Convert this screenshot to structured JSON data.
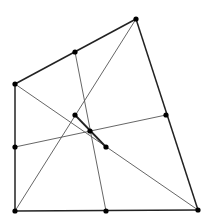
{
  "diagram": {
    "kind": "quadrilateral-varignon-newton",
    "colors": {
      "background": "#ffffff",
      "edge": "#222222",
      "thin_line": "#555555",
      "point": "#000000"
    },
    "vertices": [
      {
        "id": "A",
        "x": 15,
        "y": 84
      },
      {
        "id": "B",
        "x": 136,
        "y": 19
      },
      {
        "id": "C",
        "x": 198,
        "y": 210
      },
      {
        "id": "D",
        "x": 15,
        "y": 211
      }
    ],
    "side_midpoints": [
      {
        "id": "M_AB",
        "x": 75,
        "y": 52
      },
      {
        "id": "M_BC",
        "x": 166,
        "y": 115
      },
      {
        "id": "M_CD",
        "x": 106,
        "y": 211
      },
      {
        "id": "M_DA",
        "x": 15,
        "y": 147
      }
    ],
    "inner_points": [
      {
        "id": "P_BD",
        "x": 75,
        "y": 115
      },
      {
        "id": "G",
        "x": 90,
        "y": 131
      },
      {
        "id": "P_AC",
        "x": 106,
        "y": 147
      }
    ]
  }
}
